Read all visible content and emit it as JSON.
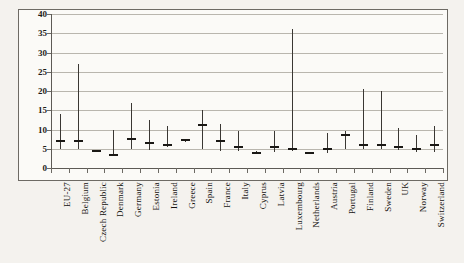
{
  "figure": {
    "caption_fragment": "",
    "frame_color": "#6d6a64",
    "plot_background": "#fbfaf7",
    "page_background": "#f4f2ee",
    "line_color": "#3a3733",
    "marker_color": "#1a1815",
    "grid_color": "#b9b6ae"
  },
  "chart_data": {
    "type": "bar",
    "subtype": "range-whisker",
    "title": "",
    "subtitle": "",
    "xlabel": "",
    "ylabel": "",
    "ylim": [
      0,
      40
    ],
    "yticks": [
      0,
      5,
      10,
      15,
      20,
      25,
      30,
      35,
      40
    ],
    "ytick_labels": [
      "0",
      "5",
      "10",
      "15",
      "20",
      "25",
      "30",
      "35",
      "40"
    ],
    "grid": true,
    "grid_axis": "y",
    "legend": false,
    "legend_position": "none",
    "categories": [
      "EU-27",
      "Belgium",
      "Czech Republic",
      "Denmark",
      "Germany",
      "Estonia",
      "Ireland",
      "Greece",
      "Spain",
      "France",
      "Italy",
      "Cyprus",
      "Latvia",
      "Luxembourg",
      "Netherlands",
      "Austria",
      "Portugal",
      "Finland",
      "Sweden",
      "UK",
      "Norway",
      "Switzerland"
    ],
    "series": [
      {
        "name": "range_low",
        "values": [
          5.0,
          5.0,
          4.3,
          3.2,
          5.0,
          4.8,
          5.5,
          6.8,
          5.0,
          4.5,
          4.5,
          3.8,
          4.2,
          4.5,
          3.9,
          4.0,
          5.0,
          5.0,
          5.0,
          4.6,
          4.2,
          4.2
        ]
      },
      {
        "name": "range_high",
        "values": [
          14.0,
          27.0,
          4.6,
          10.0,
          17.0,
          12.5,
          11.0,
          7.2,
          15.0,
          11.5,
          9.5,
          4.3,
          9.5,
          36.0,
          4.1,
          9.0,
          9.5,
          20.5,
          20.0,
          10.5,
          8.5,
          11.0
        ]
      },
      {
        "name": "marker",
        "values": [
          7.0,
          7.0,
          4.4,
          3.5,
          7.5,
          6.5,
          6.0,
          7.2,
          11.2,
          7.0,
          5.5,
          4.0,
          5.5,
          5.0,
          4.0,
          5.0,
          8.5,
          6.0,
          6.0,
          5.5,
          5.0,
          6.0
        ]
      }
    ]
  }
}
